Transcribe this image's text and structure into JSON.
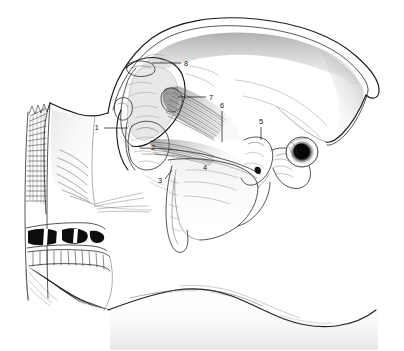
{
  "figure": {
    "domain": "anatomical line drawing",
    "background_color": "#ffffff",
    "ink_color": "#1a1a1a",
    "technique": "pen-and-ink stipple and hatch line drawing",
    "width": 404,
    "height": 351
  },
  "labels": [
    {
      "id": "1",
      "text": "1",
      "text_x": 99,
      "text_y": 130,
      "leader_x1": 104,
      "leader_y1": 128,
      "leader_x2": 128,
      "leader_y2": 128,
      "leader_kind": "horizontal"
    },
    {
      "id": "2",
      "text": "2",
      "text_x": 153,
      "text_y": 150,
      "leader_kind": "none"
    },
    {
      "id": "3",
      "text": "3",
      "text_x": 160,
      "text_y": 183,
      "leader_x1": 165,
      "leader_y1": 179,
      "leader_x2": 172,
      "leader_y2": 170,
      "leader_kind": "diagonal"
    },
    {
      "id": "4",
      "text": "4",
      "text_x": 205,
      "text_y": 170,
      "leader_kind": "none"
    },
    {
      "id": "5",
      "text": "5",
      "text_x": 258,
      "text_y": 124,
      "leader_x1": 261,
      "leader_y1": 127,
      "leader_x2": 261,
      "leader_y2": 140,
      "leader_kind": "vertical"
    },
    {
      "id": "6",
      "text": "6",
      "text_x": 219,
      "text_y": 108,
      "leader_x1": 222,
      "leader_y1": 111,
      "leader_x2": 222,
      "leader_y2": 142,
      "leader_kind": "vertical"
    },
    {
      "id": "7",
      "text": "7",
      "text_x": 208,
      "text_y": 99,
      "leader_x1": 206,
      "leader_y1": 97,
      "leader_x2": 178,
      "leader_y2": 97,
      "leader_kind": "horizontal"
    },
    {
      "id": "8",
      "text": "8",
      "text_x": 183,
      "text_y": 66,
      "leader_x1": 181,
      "leader_y1": 63,
      "leader_x2": 152,
      "leader_y2": 63,
      "leader_kind": "horizontal"
    }
  ],
  "regions": [
    {
      "name": "pinna-ear-outline",
      "description": "large double-line ear / pinna contour sweeping across the upper right"
    },
    {
      "name": "cut-surface-hatching",
      "description": "dense vertical hatching along the left sectioned edge"
    },
    {
      "name": "teeth-block",
      "description": "upper and lower tooth rows with black-filled enamel areas at lower left"
    },
    {
      "name": "temporalis-muscle",
      "description": "striated fan of muscle fibers in the central skull area"
    },
    {
      "name": "mandible-condyle",
      "description": "articular condyle and joint at upper centre near label 8"
    },
    {
      "name": "pterygoid-bone",
      "description": "irregular bony mass marked 2"
    },
    {
      "name": "soft-palate-tongue",
      "description": "broad pale region marked 4"
    },
    {
      "name": "external-auditory-meatus",
      "description": "dark circular ear canal opening at right"
    },
    {
      "name": "neck-contour",
      "description": "long sweeping lower jaw and neck outline running to lower right"
    }
  ]
}
